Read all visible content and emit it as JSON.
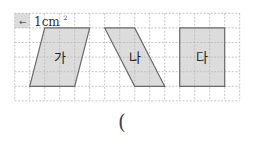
{
  "grid": {
    "origin_x": 14.7,
    "origin_y": 13.3,
    "cell_w": 15,
    "cell_h": 14.6,
    "cols": 15,
    "rows": 6,
    "line_color": "#b8b8b8",
    "shade_color": "#dcdcdc",
    "outline_color": "#6a6a6a"
  },
  "legend": {
    "arrow": "←",
    "label": "1cm",
    "superscript": "2"
  },
  "shapes": [
    {
      "label": "가",
      "points": [
        [
          2,
          1
        ],
        [
          5,
          1
        ],
        [
          4,
          5
        ],
        [
          1,
          5
        ]
      ],
      "label_pos": [
        3,
        3
      ]
    },
    {
      "label": "나",
      "points": [
        [
          6,
          1
        ],
        [
          8,
          1
        ],
        [
          10,
          5
        ],
        [
          8,
          5
        ]
      ],
      "label_pos": [
        8,
        3
      ]
    },
    {
      "label": "다",
      "points": [
        [
          11,
          1
        ],
        [
          14,
          1
        ],
        [
          14,
          5
        ],
        [
          11,
          5
        ]
      ],
      "label_pos": [
        12.5,
        3
      ]
    }
  ],
  "answer": {
    "open_paren": "("
  }
}
